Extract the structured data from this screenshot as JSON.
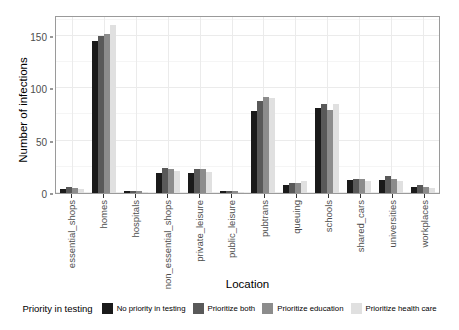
{
  "chart_data": {
    "type": "bar",
    "title": "",
    "xlabel": "Location",
    "ylabel": "Number of infections",
    "ylim": [
      0,
      170
    ],
    "yticks": [
      0,
      50,
      100,
      150
    ],
    "ytick_labels": [
      "0",
      "50",
      "100",
      "150"
    ],
    "grid": true,
    "legend_position": "bottom",
    "legend_title": "Priority in testing",
    "categories": [
      "essential_shops",
      "homes",
      "hospitals",
      "non_essential_shops",
      "private_leisure",
      "public_leisure",
      "pubtrans",
      "queuing",
      "schools",
      "shared_cars",
      "universities",
      "workplaces"
    ],
    "series": [
      {
        "name": "No priority in testing",
        "color": "#1a1a1a",
        "values": [
          4,
          145,
          2,
          19,
          19,
          2,
          78,
          8,
          81,
          12,
          12,
          6
        ]
      },
      {
        "name": "Prioritize both",
        "color": "#595959",
        "values": [
          6,
          150,
          2,
          24,
          23,
          2,
          88,
          10,
          85,
          13,
          16,
          8
        ]
      },
      {
        "name": "Prioritize education",
        "color": "#8c8c8c",
        "values": [
          5,
          152,
          2,
          23,
          23,
          2,
          92,
          10,
          79,
          13,
          13,
          6
        ]
      },
      {
        "name": "Prioritize health care",
        "color": "#e0e0e0",
        "values": [
          4,
          160,
          1,
          21,
          20,
          1,
          91,
          11,
          85,
          11,
          11,
          5
        ]
      }
    ]
  }
}
